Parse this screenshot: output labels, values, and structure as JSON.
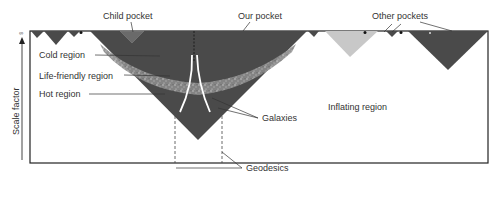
{
  "diagram": {
    "axis": {
      "y_label": "Scale factor",
      "y_top_symbol": "∞"
    },
    "labels": {
      "child_pocket": "Child pocket",
      "our_pocket": "Our pocket",
      "other_pockets": "Other pockets",
      "cold_region": "Cold region",
      "life_friendly_region": "Life-friendly region",
      "hot_region": "Hot region",
      "galaxies": "Galaxies",
      "inflating_region": "Inflating region",
      "geodesics": "Geodesics"
    },
    "colors": {
      "pocket_dark": "#4a4a4a",
      "pocket_light": "#c8c8c8",
      "band_light": "#9a9a9a",
      "frame": "#222222",
      "text": "#333333"
    }
  }
}
